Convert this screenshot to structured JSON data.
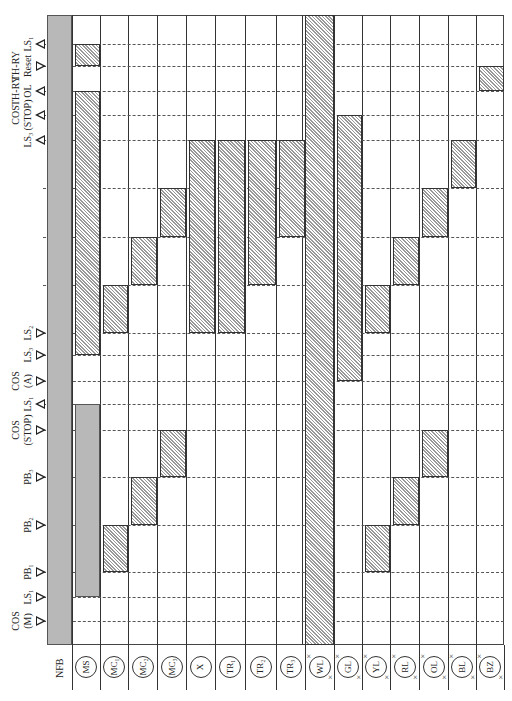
{
  "diagram": {
    "type": "timing-sequence-chart",
    "orientation": "rotated-90",
    "frame": {
      "left": 47,
      "top": 15,
      "right": 504,
      "bottom": 645
    },
    "columns": [
      {
        "id": "NFB",
        "label": "NFB",
        "x0": 47,
        "x1": 72,
        "style": "text"
      },
      {
        "id": "MS",
        "label": "MS",
        "x0": 72,
        "x1": 100,
        "style": "circle"
      },
      {
        "id": "MC1",
        "label": "MC₁",
        "x0": 100,
        "x1": 128,
        "style": "circle"
      },
      {
        "id": "MC2",
        "label": "MC₂",
        "x0": 128,
        "x1": 157,
        "style": "circle"
      },
      {
        "id": "MC3",
        "label": "MC₃",
        "x0": 157,
        "x1": 186,
        "style": "circle"
      },
      {
        "id": "X",
        "label": "X",
        "x0": 186,
        "x1": 215,
        "style": "circle"
      },
      {
        "id": "TR1",
        "label": "TR₁",
        "x0": 215,
        "x1": 245,
        "style": "circle"
      },
      {
        "id": "TR2",
        "label": "TR₂",
        "x0": 245,
        "x1": 276,
        "style": "circle"
      },
      {
        "id": "TR3",
        "label": "TR₃",
        "x0": 276,
        "x1": 305,
        "style": "circle"
      },
      {
        "id": "WL",
        "label": "WL",
        "x0": 305,
        "x1": 334,
        "style": "lamp"
      },
      {
        "id": "GL",
        "label": "GL",
        "x0": 334,
        "x1": 362,
        "style": "lamp"
      },
      {
        "id": "YL",
        "label": "YL",
        "x0": 362,
        "x1": 390,
        "style": "lamp"
      },
      {
        "id": "RL",
        "label": "RL",
        "x0": 390,
        "x1": 419,
        "style": "lamp"
      },
      {
        "id": "OL",
        "label": "OL",
        "x0": 419,
        "x1": 448,
        "style": "lamp"
      },
      {
        "id": "BL",
        "label": "BL",
        "x0": 448,
        "x1": 476,
        "style": "lamp"
      },
      {
        "id": "BZ",
        "label": "BZ",
        "x0": 476,
        "x1": 504,
        "style": "lamp"
      }
    ],
    "events": [
      {
        "y": 44,
        "label": "LS₁",
        "sub": "",
        "dir": "left"
      },
      {
        "y": 66,
        "label": "Reset",
        "sub": "TH-RY",
        "dir": "right"
      },
      {
        "y": 91,
        "label": "OL",
        "sub": "TH-RY",
        "dir": "left"
      },
      {
        "y": 115,
        "label": "(STOP)",
        "sub": "COS",
        "dir": "left"
      },
      {
        "y": 140,
        "label": "LS₃",
        "sub": "",
        "dir": "left"
      },
      {
        "y": 188,
        "label": "",
        "sub": "",
        "dir": "none"
      },
      {
        "y": 237,
        "label": "",
        "sub": "",
        "dir": "none"
      },
      {
        "y": 285,
        "label": "",
        "sub": "",
        "dir": "none"
      },
      {
        "y": 333,
        "label": "LS₂",
        "sub": "",
        "dir": "right"
      },
      {
        "y": 355,
        "label": "LS₃",
        "sub": "",
        "dir": "right"
      },
      {
        "y": 381,
        "label": "(A)",
        "sub": "COS",
        "dir": "right"
      },
      {
        "y": 404,
        "label": "LS₁",
        "sub": "",
        "dir": "left"
      },
      {
        "y": 430,
        "label": "(STOP)",
        "sub": "COS",
        "dir": "right"
      },
      {
        "y": 477,
        "label": "PB₃",
        "sub": "",
        "dir": "right"
      },
      {
        "y": 525,
        "label": "PB₂",
        "sub": "",
        "dir": "right"
      },
      {
        "y": 572,
        "label": "PB₁",
        "sub": "",
        "dir": "right"
      },
      {
        "y": 597,
        "label": "LS₁",
        "sub": "",
        "dir": "right"
      },
      {
        "y": 621,
        "label": "(M)",
        "sub": "COS",
        "dir": "right"
      }
    ],
    "bars": [
      {
        "col": "NFB",
        "y0": 15,
        "y1": 645,
        "fill": "solid"
      },
      {
        "col": "MS",
        "y0": 44,
        "y1": 66,
        "fill": "hatched"
      },
      {
        "col": "MS",
        "y0": 91,
        "y1": 355,
        "fill": "hatched"
      },
      {
        "col": "MS",
        "y0": 404,
        "y1": 597,
        "fill": "solid"
      },
      {
        "col": "MC1",
        "y0": 285,
        "y1": 333,
        "fill": "hatched"
      },
      {
        "col": "MC1",
        "y0": 525,
        "y1": 572,
        "fill": "hatched"
      },
      {
        "col": "MC2",
        "y0": 237,
        "y1": 285,
        "fill": "hatched"
      },
      {
        "col": "MC2",
        "y0": 477,
        "y1": 525,
        "fill": "hatched"
      },
      {
        "col": "MC3",
        "y0": 188,
        "y1": 237,
        "fill": "hatched"
      },
      {
        "col": "MC3",
        "y0": 430,
        "y1": 477,
        "fill": "hatched"
      },
      {
        "col": "X",
        "y0": 140,
        "y1": 333,
        "fill": "hatched"
      },
      {
        "col": "TR1",
        "y0": 140,
        "y1": 333,
        "fill": "hatched"
      },
      {
        "col": "TR2",
        "y0": 140,
        "y1": 285,
        "fill": "hatched"
      },
      {
        "col": "TR3",
        "y0": 140,
        "y1": 237,
        "fill": "hatched"
      },
      {
        "col": "WL",
        "y0": 15,
        "y1": 645,
        "fill": "hatched"
      },
      {
        "col": "GL",
        "y0": 115,
        "y1": 381,
        "fill": "hatched"
      },
      {
        "col": "YL",
        "y0": 285,
        "y1": 333,
        "fill": "hatched"
      },
      {
        "col": "YL",
        "y0": 525,
        "y1": 572,
        "fill": "hatched"
      },
      {
        "col": "RL",
        "y0": 237,
        "y1": 285,
        "fill": "hatched"
      },
      {
        "col": "RL",
        "y0": 477,
        "y1": 525,
        "fill": "hatched"
      },
      {
        "col": "OL",
        "y0": 188,
        "y1": 237,
        "fill": "hatched"
      },
      {
        "col": "OL",
        "y0": 430,
        "y1": 477,
        "fill": "hatched"
      },
      {
        "col": "BL",
        "y0": 140,
        "y1": 188,
        "fill": "hatched"
      },
      {
        "col": "BZ",
        "y0": 66,
        "y1": 91,
        "fill": "hatched"
      }
    ],
    "colors": {
      "solid": "#b8b8b8",
      "hatch": "#999999",
      "line": "#333333"
    }
  }
}
